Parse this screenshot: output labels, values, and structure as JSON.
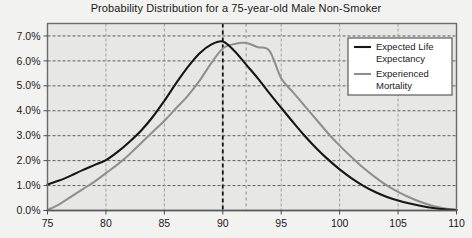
{
  "chart_data": {
    "type": "line",
    "title": "Probability Distribution for a 75-year-old Male Non-Smoker",
    "xlabel": "",
    "ylabel": "",
    "xlim": [
      75,
      110
    ],
    "ylim": [
      0,
      7.5
    ],
    "xticks": [
      75,
      80,
      85,
      90,
      95,
      100,
      105,
      110
    ],
    "xticklabels": [
      "75",
      "80",
      "85",
      "90",
      "95",
      "100",
      "105",
      "110"
    ],
    "yticks": [
      0,
      1,
      2,
      3,
      4,
      5,
      6,
      7
    ],
    "yticklabels": [
      "0.0%",
      "1.0%",
      "2.0%",
      "3.0%",
      "4.0%",
      "5.0%",
      "6.0%",
      "7.0%"
    ],
    "grid": true,
    "grid_style": "dashed",
    "legend_position": "upper right",
    "plot_background": "#e7e7e5",
    "page_background": "#f2f2f0",
    "series": [
      {
        "name": "Expected Life Expectancy",
        "color": "#161616",
        "width": 2.1,
        "x": [
          75,
          76,
          77,
          78,
          79,
          80,
          81,
          82,
          83,
          84,
          85,
          86,
          87,
          88,
          89,
          90,
          91,
          92,
          93,
          94,
          95,
          96,
          97,
          98,
          99,
          100,
          101,
          102,
          103,
          104,
          105,
          106,
          107,
          108,
          109,
          110
        ],
        "values": [
          1.05,
          1.2,
          1.4,
          1.62,
          1.82,
          2.02,
          2.35,
          2.75,
          3.2,
          3.75,
          4.4,
          5.1,
          5.75,
          6.3,
          6.65,
          6.78,
          6.4,
          5.85,
          5.3,
          4.7,
          4.12,
          3.55,
          3.0,
          2.5,
          2.05,
          1.65,
          1.3,
          1.0,
          0.75,
          0.55,
          0.4,
          0.28,
          0.18,
          0.1,
          0.05,
          0.02
        ]
      },
      {
        "name": "Experienced Mortality",
        "color": "#8e8e8e",
        "width": 2.0,
        "x": [
          75,
          76,
          77,
          78,
          79,
          80,
          81,
          82,
          83,
          84,
          85,
          86,
          87,
          88,
          89,
          90,
          91,
          92,
          93,
          94,
          95,
          96,
          97,
          98,
          99,
          100,
          101,
          102,
          103,
          104,
          105,
          106,
          107,
          108,
          109,
          110
        ],
        "values": [
          0.02,
          0.25,
          0.55,
          0.85,
          1.15,
          1.5,
          1.85,
          2.25,
          2.7,
          3.15,
          3.6,
          4.1,
          4.6,
          5.2,
          5.9,
          6.5,
          6.68,
          6.72,
          6.55,
          6.4,
          5.3,
          4.75,
          4.2,
          3.65,
          3.1,
          2.6,
          2.15,
          1.72,
          1.35,
          1.02,
          0.75,
          0.52,
          0.33,
          0.18,
          0.08,
          0.02
        ]
      }
    ],
    "vertical_markers": [
      {
        "name": "expected-life-expectancy-marker",
        "x": 90,
        "color": "#161616",
        "style": "dashed",
        "width": 1.8
      },
      {
        "name": "experienced-mortality-marker",
        "x": 92,
        "color": "#9a9a9a",
        "style": "dashed",
        "width": 1.2
      }
    ],
    "legend": [
      {
        "label_line1": "Expected Life",
        "label_line2": "Expectancy",
        "color": "#161616"
      },
      {
        "label_line1": "Experienced",
        "label_line2": "Mortality",
        "color": "#8e8e8e"
      }
    ]
  }
}
